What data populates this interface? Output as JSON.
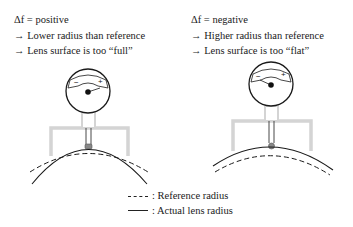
{
  "left_panel": {
    "condition": "Δf = positive",
    "lines": [
      "→ Lower radius than reference",
      "→ Lens surface is too “full”"
    ],
    "gauge": {
      "minus_label": "−",
      "plus_label": "+"
    }
  },
  "right_panel": {
    "condition": "Δf = negative",
    "lines": [
      "→ Higher radius than reference",
      "→ Lens surface is too “flat”"
    ],
    "gauge": {
      "minus_label": "−",
      "plus_label": "+"
    }
  },
  "legend": {
    "items": [
      {
        "style": "dashed",
        "label": ": Reference radius"
      },
      {
        "style": "solid",
        "label": ": Actual lens radius"
      }
    ]
  },
  "colors": {
    "frame": "#d4d4d4",
    "line": "#1a1a1a",
    "contact_ball": "#888888"
  }
}
